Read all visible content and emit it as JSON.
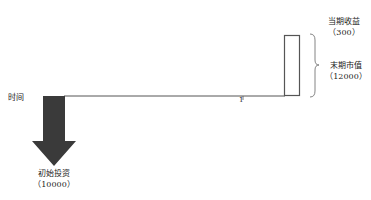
{
  "diagram": {
    "time_label": "时间",
    "period_tick": "1",
    "initial_investment": {
      "label": "初始投资",
      "value": "（10000）"
    },
    "current_income": {
      "label": "当期收益",
      "value": "（300）"
    },
    "ending_market_value": {
      "label": "末期市值",
      "value": "（12000）"
    },
    "colors": {
      "arrow": "#3a3a3a",
      "line": "#444444",
      "box": "#555555"
    }
  }
}
